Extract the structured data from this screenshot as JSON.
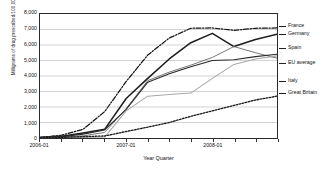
{
  "chart_data": {
    "type": "line",
    "title": "",
    "xlabel": "Year Quarter",
    "ylabel": "Milligrams of drug prescribed/100,000 population",
    "ylim": [
      0,
      8000
    ],
    "ytick_labels": [
      "8,000",
      "7,000",
      "6,000",
      "5,000",
      "4,000",
      "3,000",
      "2,000",
      "1,000",
      "0"
    ],
    "ytick_values": [
      8000,
      7000,
      6000,
      5000,
      4000,
      3000,
      2000,
      1000,
      0
    ],
    "grid": true,
    "grid_axis": "y",
    "legend_position": "right-outside",
    "x": [
      "2006-01",
      "2006-02",
      "2006-03",
      "2006-04",
      "2007-01",
      "2007-02",
      "2007-03",
      "2007-04",
      "2008-01",
      "2008-02",
      "2008-03",
      "2008-04"
    ],
    "xtick_labels": [
      "2006-01",
      "2007-01",
      "2008-01"
    ],
    "xtick_positions": [
      0,
      4,
      8
    ],
    "series": [
      {
        "name": "France",
        "style": "dash-dot",
        "color": "#141414",
        "values": [
          30,
          180,
          560,
          1700,
          3650,
          5350,
          6450,
          7080,
          7100,
          6950,
          7080,
          7100
        ]
      },
      {
        "name": "Germany",
        "style": "solid-thick",
        "color": "#1e1e1e",
        "values": [
          40,
          120,
          330,
          560,
          2550,
          3850,
          5100,
          6150,
          6750,
          5900,
          6350,
          6700
        ]
      },
      {
        "name": "Spain",
        "style": "solid-medium",
        "color": "#6e6e6e",
        "values": [
          20,
          60,
          140,
          360,
          1900,
          3700,
          4250,
          4700,
          5200,
          5900,
          5500,
          5150
        ]
      },
      {
        "name": "EU average",
        "style": "solid-dark",
        "color": "#2a2a2a",
        "values": [
          25,
          90,
          250,
          520,
          1850,
          3600,
          4150,
          4600,
          5000,
          5050,
          5250,
          5400
        ]
      },
      {
        "name": "Italy",
        "style": "solid-light",
        "color": "#a8a8a8",
        "values": [
          10,
          20,
          40,
          60,
          1750,
          2700,
          2800,
          2900,
          3850,
          4750,
          5100,
          5300
        ]
      },
      {
        "name": "Great Britain",
        "style": "dotted",
        "color": "#1a1a1a",
        "values": [
          15,
          40,
          90,
          130,
          420,
          700,
          1000,
          1400,
          1750,
          2100,
          2450,
          2700
        ]
      }
    ]
  },
  "legend": {
    "items": [
      {
        "label": "France"
      },
      {
        "label": "Germany"
      },
      {
        "label": "Spain"
      },
      {
        "label": "EU average"
      },
      {
        "label": "Italy"
      },
      {
        "label": "Great Britain"
      }
    ]
  }
}
